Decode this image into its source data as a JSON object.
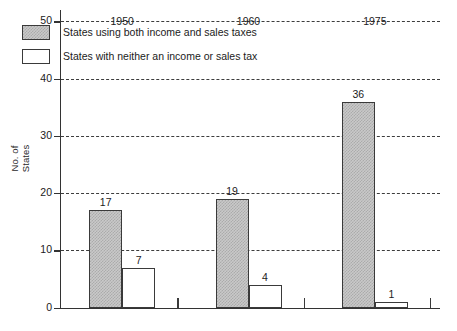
{
  "chart_data": {
    "type": "bar",
    "title": "",
    "subtitle": "",
    "xlabel": "",
    "ylabel": "No. of\nStates",
    "categories": [
      "1950",
      "1960",
      "1975"
    ],
    "series": [
      {
        "name": "States using both income and sales taxes",
        "style": "gray-hatched",
        "values": [
          17,
          19,
          36
        ]
      },
      {
        "name": "States with neither an income or sales tax",
        "style": "white-outline",
        "values": [
          7,
          4,
          1
        ]
      }
    ],
    "ylim": [
      0,
      52
    ],
    "yticks": [
      0,
      10,
      20,
      30,
      40,
      50
    ],
    "ytick_labels": [
      "0",
      "10",
      "20",
      "30",
      "40",
      "50"
    ],
    "grid": "horizontal-dashed",
    "legend_position": "upper-left-inside",
    "value_labels_shown": true,
    "colors": {
      "series1_fill": "#c9c9c9",
      "series1_hatch": "#ababab",
      "series2_fill": "#ffffff",
      "bar_border": "#3a3a3a",
      "axis": "#333333",
      "grid": "#3d3d3d",
      "text": "#1b1b1b",
      "background": "#ffffff"
    }
  }
}
